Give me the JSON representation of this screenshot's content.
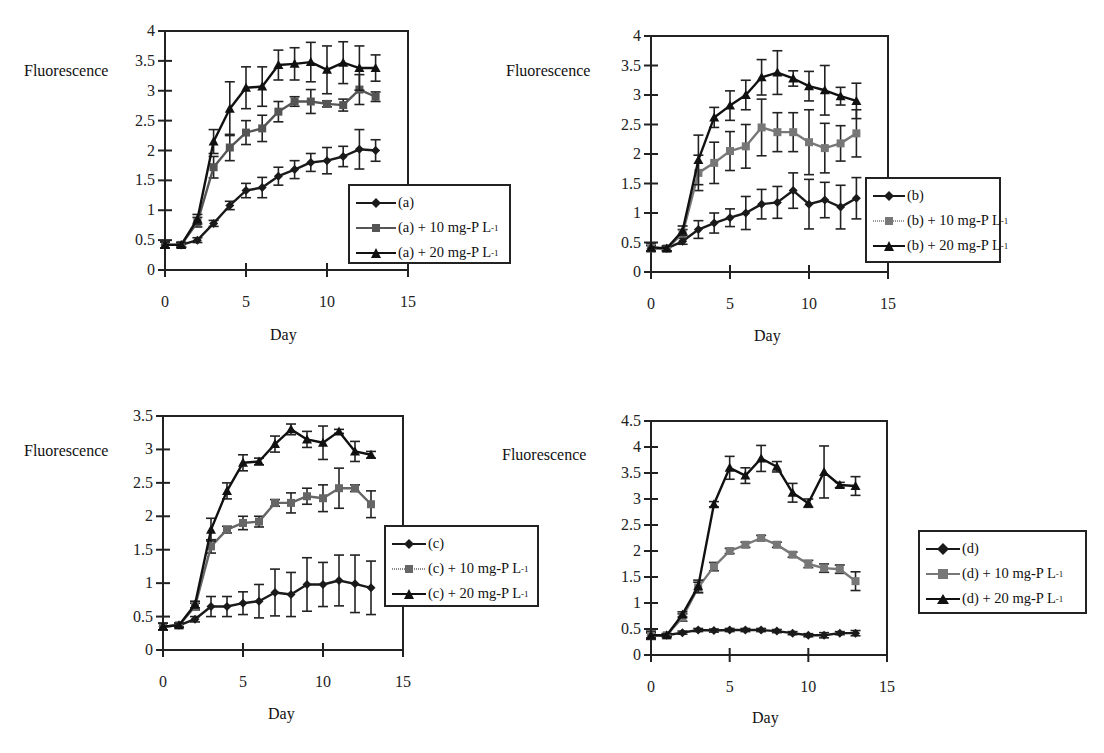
{
  "chart_data": [
    {
      "id": "a",
      "type": "line",
      "title": "",
      "xlabel": "Day",
      "ylabel": "Fluorescence",
      "xlim": [
        0,
        15
      ],
      "ylim": [
        0,
        4
      ],
      "xticks": [
        0,
        5,
        10,
        15
      ],
      "yticks": [
        0,
        0.5,
        1,
        1.5,
        2,
        2.5,
        3,
        3.5,
        4
      ],
      "grid": false,
      "legend_position": "lower-right-outside",
      "x": [
        0,
        1,
        2,
        3,
        4,
        5,
        6,
        7,
        8,
        9,
        10,
        11,
        12,
        13
      ],
      "series": [
        {
          "name": "(a)",
          "marker": "diamond",
          "color": "#1a1a1a",
          "values": [
            0.42,
            0.42,
            0.5,
            0.78,
            1.08,
            1.33,
            1.38,
            1.57,
            1.68,
            1.8,
            1.83,
            1.9,
            2.02,
            2.0
          ],
          "errors": [
            0.05,
            0.04,
            0.04,
            0.05,
            0.07,
            0.12,
            0.17,
            0.15,
            0.15,
            0.15,
            0.22,
            0.17,
            0.33,
            0.18
          ]
        },
        {
          "name": "(a) + 10 mg-P L-1",
          "marker": "square",
          "color": "#555555",
          "values": [
            0.42,
            0.42,
            0.8,
            1.72,
            2.05,
            2.3,
            2.37,
            2.65,
            2.82,
            2.82,
            2.78,
            2.76,
            3.02,
            2.9
          ],
          "errors": [
            0.05,
            0.04,
            0.08,
            0.18,
            0.22,
            0.2,
            0.22,
            0.17,
            0.08,
            0.2,
            0.05,
            0.1,
            0.25,
            0.08
          ]
        },
        {
          "name": "(a) + 20 mg-P L-1",
          "marker": "triangle",
          "color": "#111111",
          "values": [
            0.42,
            0.42,
            0.85,
            2.15,
            2.7,
            3.05,
            3.07,
            3.43,
            3.45,
            3.48,
            3.35,
            3.47,
            3.38,
            3.38
          ],
          "errors": [
            0.05,
            0.04,
            0.08,
            0.2,
            0.45,
            0.35,
            0.33,
            0.25,
            0.27,
            0.33,
            0.4,
            0.35,
            0.37,
            0.22
          ]
        }
      ]
    },
    {
      "id": "b",
      "type": "line",
      "title": "",
      "xlabel": "Day",
      "ylabel": "Fluorescence",
      "xlim": [
        0,
        15
      ],
      "ylim": [
        0,
        4
      ],
      "xticks": [
        0,
        5,
        10,
        15
      ],
      "yticks": [
        0,
        0.5,
        1,
        1.5,
        2,
        2.5,
        3,
        3.5,
        4
      ],
      "grid": false,
      "legend_position": "lower-right-outside",
      "x": [
        0,
        1,
        2,
        3,
        4,
        5,
        6,
        7,
        8,
        9,
        10,
        11,
        12,
        13
      ],
      "series": [
        {
          "name": "(b)",
          "marker": "diamond",
          "color": "#1a1a1a",
          "values": [
            0.4,
            0.4,
            0.52,
            0.72,
            0.83,
            0.92,
            1.0,
            1.15,
            1.18,
            1.38,
            1.15,
            1.22,
            1.1,
            1.25
          ],
          "errors": [
            0.05,
            0.04,
            0.05,
            0.15,
            0.17,
            0.15,
            0.28,
            0.25,
            0.27,
            0.3,
            0.42,
            0.3,
            0.37,
            0.35
          ]
        },
        {
          "name": "(b) + 10 mg-P L-1",
          "marker": "square",
          "color": "#777777",
          "values": [
            0.4,
            0.4,
            0.65,
            1.68,
            1.85,
            2.05,
            2.13,
            2.45,
            2.37,
            2.37,
            2.2,
            2.1,
            2.18,
            2.35
          ],
          "errors": [
            0.05,
            0.04,
            0.07,
            0.3,
            0.35,
            0.33,
            0.37,
            0.48,
            0.33,
            0.33,
            0.55,
            0.42,
            0.3,
            0.4
          ]
        },
        {
          "name": "(b) + 20 mg-P L-1",
          "marker": "triangle",
          "color": "#111111",
          "values": [
            0.42,
            0.4,
            0.7,
            1.9,
            2.62,
            2.82,
            3.0,
            3.3,
            3.38,
            3.28,
            3.15,
            3.08,
            2.98,
            2.9
          ],
          "errors": [
            0.07,
            0.04,
            0.08,
            0.42,
            0.17,
            0.25,
            0.25,
            0.3,
            0.37,
            0.13,
            0.25,
            0.42,
            0.15,
            0.3
          ]
        }
      ]
    },
    {
      "id": "c",
      "type": "line",
      "title": "",
      "xlabel": "Day",
      "ylabel": "Fluorescence",
      "xlim": [
        0,
        15
      ],
      "ylim": [
        0,
        3.5
      ],
      "xticks": [
        0,
        5,
        10,
        15
      ],
      "yticks": [
        0,
        0.5,
        1,
        1.5,
        2,
        2.5,
        3,
        3.5
      ],
      "grid": false,
      "legend_position": "right-outside",
      "x": [
        0,
        1,
        2,
        3,
        4,
        5,
        6,
        7,
        8,
        9,
        10,
        11,
        12,
        13
      ],
      "series": [
        {
          "name": "(c)",
          "marker": "diamond",
          "color": "#1a1a1a",
          "values": [
            0.35,
            0.37,
            0.46,
            0.65,
            0.65,
            0.7,
            0.73,
            0.86,
            0.83,
            0.98,
            0.98,
            1.04,
            0.99,
            0.93
          ],
          "errors": [
            0.05,
            0.03,
            0.04,
            0.15,
            0.15,
            0.17,
            0.25,
            0.35,
            0.33,
            0.4,
            0.33,
            0.38,
            0.43,
            0.4
          ]
        },
        {
          "name": "(c) + 10 mg-P L-1",
          "marker": "square",
          "color": "#666666",
          "values": [
            0.35,
            0.37,
            0.65,
            1.55,
            1.8,
            1.9,
            1.92,
            2.2,
            2.2,
            2.3,
            2.27,
            2.42,
            2.42,
            2.18
          ],
          "errors": [
            0.05,
            0.03,
            0.05,
            0.1,
            0.05,
            0.1,
            0.08,
            0.05,
            0.15,
            0.12,
            0.2,
            0.3,
            0.05,
            0.2
          ]
        },
        {
          "name": "(c) + 20 mg-P L-1",
          "marker": "triangle",
          "color": "#111111",
          "values": [
            0.35,
            0.37,
            0.68,
            1.8,
            2.38,
            2.8,
            2.82,
            3.08,
            3.3,
            3.15,
            3.1,
            3.27,
            2.97,
            2.92
          ],
          "errors": [
            0.05,
            0.03,
            0.05,
            0.17,
            0.12,
            0.12,
            0.05,
            0.12,
            0.08,
            0.12,
            0.25,
            0.03,
            0.15,
            0.05
          ]
        }
      ]
    },
    {
      "id": "d",
      "type": "line",
      "title": "",
      "xlabel": "Day",
      "ylabel": "Fluorescence",
      "xlim": [
        0,
        15
      ],
      "ylim": [
        0,
        4.5
      ],
      "xticks": [
        0,
        5,
        10,
        15
      ],
      "yticks": [
        0,
        0.5,
        1,
        1.5,
        2,
        2.5,
        3,
        3.5,
        4,
        4.5
      ],
      "grid": false,
      "legend_position": "right-outside",
      "x": [
        0,
        1,
        2,
        3,
        4,
        5,
        6,
        7,
        8,
        9,
        10,
        11,
        12,
        13
      ],
      "series": [
        {
          "name": "(d)",
          "marker": "diamond",
          "color": "#1a1a1a",
          "values": [
            0.38,
            0.38,
            0.43,
            0.48,
            0.47,
            0.48,
            0.48,
            0.48,
            0.46,
            0.42,
            0.38,
            0.38,
            0.42,
            0.42
          ],
          "errors": [
            0.05,
            0.03,
            0.03,
            0.03,
            0.03,
            0.03,
            0.03,
            0.03,
            0.03,
            0.03,
            0.03,
            0.05,
            0.03,
            0.05
          ]
        },
        {
          "name": "(d) + 10 mg-P L-1",
          "marker": "square",
          "color": "#777777",
          "values": [
            0.38,
            0.38,
            0.72,
            1.3,
            1.7,
            2.0,
            2.12,
            2.25,
            2.12,
            1.93,
            1.75,
            1.67,
            1.65,
            1.42
          ],
          "errors": [
            0.05,
            0.03,
            0.07,
            0.1,
            0.08,
            0.05,
            0.05,
            0.05,
            0.05,
            0.05,
            0.07,
            0.08,
            0.08,
            0.18
          ]
        },
        {
          "name": "(d) + 20 mg-P L-1",
          "marker": "triangle",
          "color": "#111111",
          "values": [
            0.38,
            0.38,
            0.78,
            1.32,
            2.9,
            3.6,
            3.45,
            3.78,
            3.62,
            3.12,
            2.92,
            3.52,
            3.27,
            3.25
          ],
          "errors": [
            0.08,
            0.03,
            0.05,
            0.12,
            0.05,
            0.22,
            0.15,
            0.25,
            0.1,
            0.18,
            0.08,
            0.5,
            0.05,
            0.18
          ]
        }
      ]
    }
  ],
  "labels": {
    "fluorescence": "Fluorescence",
    "day": "Day",
    "legend_a": [
      "(a)",
      "(a) + 10 mg-P L",
      "(a) + 20 mg-P L"
    ],
    "legend_b": [
      "(b)",
      "(b) + 10 mg-P L",
      "(b) + 20 mg-P L"
    ],
    "legend_c": [
      "(c)",
      "(c) + 10 mg-P L",
      "(c) + 20 mg-P L"
    ],
    "legend_d": [
      "(d)",
      "(d) + 10 mg-P L",
      "(d) + 20 mg-P L"
    ],
    "unit_sup": "-1"
  }
}
